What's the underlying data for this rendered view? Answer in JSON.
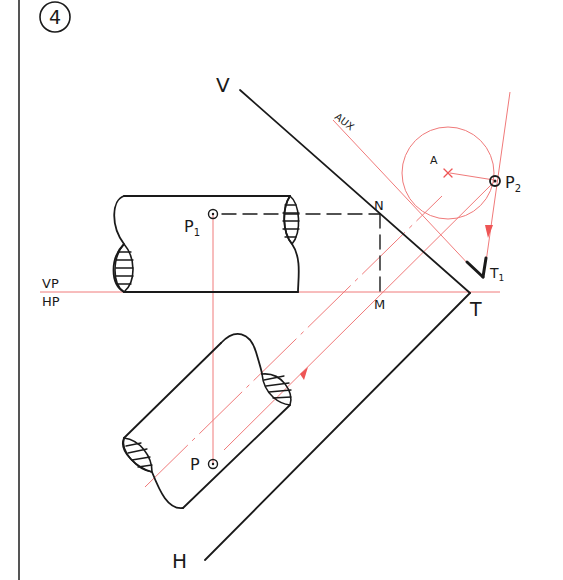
{
  "figure": {
    "number": "4",
    "colors": {
      "ink": "#1a1a1a",
      "construction": "#ee5555",
      "background": "#ffffff"
    }
  },
  "labels": {
    "trace_v": "V",
    "trace_h": "H",
    "ground_line_top": "VP",
    "ground_line_bottom": "HP",
    "aux_plane": "AUX",
    "axis_point": "A",
    "point_p1": "P",
    "point_p1_sub": "1",
    "point_p2": "P",
    "point_p2_sub": "2",
    "point_p": "P",
    "point_n": "N",
    "point_m": "M",
    "point_t": "T",
    "point_t1": "T",
    "point_t1_sub": "1"
  }
}
